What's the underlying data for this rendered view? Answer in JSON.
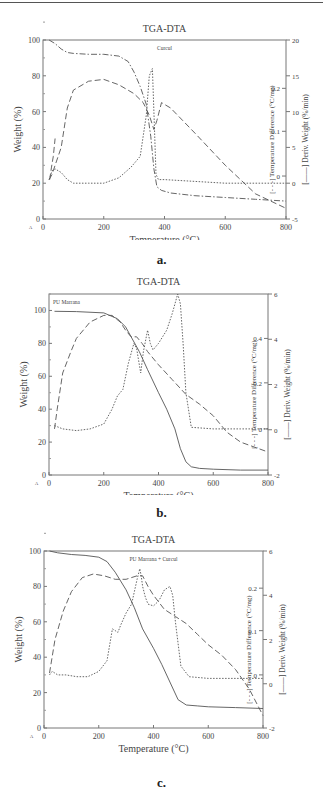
{
  "chart_data": [
    {
      "id": "a",
      "type": "line",
      "caption": "a.",
      "title": "TGA-DTA",
      "sample_label": "Curcul",
      "xlabel": "Temperature (°C)",
      "ylabel": "Weight (%)",
      "y2label": "Temperature Difference (°C/mg)",
      "y3label": "Deriv. Weight (%/min)",
      "xlim": [
        0,
        800
      ],
      "ylim": [
        0,
        100
      ],
      "y2_ticks": [
        {
          "label": "0.2",
          "weight_equiv": 73
        },
        {
          "label": "0.1",
          "weight_equiv": 49
        },
        {
          "label": "0",
          "weight_equiv": 24
        }
      ],
      "y3lim": [
        -5,
        20
      ],
      "xticks": [
        "0",
        "200",
        "400",
        "600",
        "800"
      ],
      "yticks": [
        "0",
        "20",
        "40",
        "60",
        "80",
        "100"
      ],
      "y3ticks": [
        "-5",
        "0",
        "5",
        "10",
        "15",
        "20"
      ],
      "series": [
        {
          "name": "Weight (TGA)",
          "style": "dashdot",
          "x": [
            20,
            40,
            60,
            80,
            100,
            150,
            200,
            250,
            280,
            300,
            320,
            340,
            355,
            365,
            375,
            390,
            420,
            500,
            600,
            700,
            800
          ],
          "y": [
            100,
            98,
            95,
            93,
            92.5,
            92,
            92,
            91,
            88,
            82,
            74,
            64,
            46,
            28,
            18,
            16,
            14.5,
            13,
            12,
            11,
            10
          ]
        },
        {
          "name": "DTA",
          "style": "dashed",
          "x": [
            20,
            30,
            40,
            60,
            80,
            100,
            150,
            200,
            250,
            300,
            330,
            350,
            365,
            375,
            390,
            420,
            500,
            600,
            700,
            800
          ],
          "y": [
            22,
            25,
            30,
            40,
            62,
            72,
            77,
            78,
            75,
            70,
            65,
            58,
            50,
            55,
            65,
            62,
            48,
            30,
            14,
            6
          ]
        },
        {
          "name": "Deriv. Weight (DTG)",
          "style": "dotted",
          "x": [
            20,
            30,
            40,
            60,
            80,
            100,
            150,
            200,
            250,
            290,
            320,
            340,
            350,
            360,
            365,
            372,
            380,
            400,
            500,
            600,
            700,
            800
          ],
          "y": [
            22,
            27,
            28,
            26,
            22,
            20,
            20,
            20,
            23,
            29,
            35,
            58,
            80,
            84,
            60,
            25,
            22,
            22,
            21,
            20,
            20,
            20
          ]
        },
        {
          "name": "Early spike",
          "style": "dashed",
          "x": [
            22,
            28,
            34,
            40
          ],
          "y": [
            22,
            29,
            35,
            45
          ]
        }
      ]
    },
    {
      "id": "b",
      "type": "line",
      "caption": "b.",
      "title": "TGA-DTA",
      "sample_label": "PU Marrana",
      "xlabel": "Temperature (°C)",
      "ylabel": "Weight (%)",
      "y2label": "Temperature Difference (°C/mg)",
      "y3label": "Deriv. Weight (%/min)",
      "xlim": [
        0,
        800
      ],
      "ylim": [
        0,
        110
      ],
      "y2_ticks": [
        {
          "label": "0.4",
          "weight_equiv": 83
        },
        {
          "label": "0.2",
          "weight_equiv": 56
        },
        {
          "label": "0",
          "weight_equiv": 28
        }
      ],
      "y3lim": [
        -2,
        6
      ],
      "xticks": [
        "0",
        "200",
        "400",
        "600",
        "800"
      ],
      "yticks": [
        "0",
        "20",
        "40",
        "60",
        "80",
        "100"
      ],
      "y3ticks": [
        "-2",
        "0",
        "2",
        "4",
        "6"
      ],
      "series": [
        {
          "name": "Weight (TGA)",
          "style": "solid",
          "x": [
            20,
            100,
            200,
            250,
            280,
            300,
            330,
            360,
            400,
            430,
            460,
            480,
            500,
            520,
            550,
            600,
            700,
            800
          ],
          "y": [
            99.5,
            99.3,
            98.5,
            95,
            90,
            84,
            75,
            64,
            50,
            40,
            28,
            16,
            8,
            5,
            4,
            3.5,
            3,
            3
          ]
        },
        {
          "name": "DTA",
          "style": "dashed",
          "x": [
            20,
            30,
            50,
            80,
            100,
            150,
            200,
            230,
            260,
            280,
            300,
            320,
            340,
            360,
            400,
            450,
            500,
            550,
            600,
            650,
            700,
            800
          ],
          "y": [
            28,
            40,
            62,
            75,
            83,
            93,
            97,
            97,
            93,
            88,
            84,
            84,
            80,
            75,
            67,
            58,
            49,
            43,
            36,
            26,
            20,
            14
          ]
        },
        {
          "name": "Deriv. Weight (DTG)",
          "style": "dotted",
          "x": [
            20,
            50,
            100,
            150,
            200,
            230,
            250,
            270,
            290,
            310,
            320,
            335,
            345,
            360,
            370,
            380,
            400,
            430,
            450,
            470,
            480,
            490,
            500,
            520,
            600,
            700,
            800
          ],
          "y": [
            30,
            28,
            27,
            28,
            31,
            40,
            48,
            52,
            68,
            80,
            77,
            62,
            75,
            88,
            80,
            76,
            80,
            88,
            98,
            110,
            104,
            80,
            50,
            29,
            28,
            28,
            28
          ]
        }
      ]
    },
    {
      "id": "c",
      "type": "line",
      "caption": "c.",
      "title": "TGA-DTA",
      "sample_label": "PU Marrana + Curcul",
      "xlabel": "Temperature (°C)",
      "ylabel": "Weight (%)",
      "y2label": "Temperature Difference (°C/mg)",
      "y3label": "Deriv. Weight (%/min)",
      "xlim": [
        0,
        800
      ],
      "ylim": [
        0,
        100
      ],
      "y2_ticks": [
        {
          "label": "0.2",
          "weight_equiv": 79
        },
        {
          "label": "0.1",
          "weight_equiv": 55
        },
        {
          "label": "0",
          "weight_equiv": 30
        }
      ],
      "y3lim": [
        -2,
        6
      ],
      "xticks": [
        "0",
        "200",
        "400",
        "600",
        "800"
      ],
      "yticks": [
        "0",
        "20",
        "40",
        "60",
        "80",
        "100"
      ],
      "y3ticks": [
        "-2",
        "0",
        "2",
        "4",
        "6"
      ],
      "series": [
        {
          "name": "Weight (TGA)",
          "style": "solid",
          "x": [
            20,
            50,
            100,
            150,
            200,
            230,
            260,
            300,
            330,
            360,
            400,
            430,
            460,
            490,
            520,
            560,
            600,
            700,
            800
          ],
          "y": [
            100,
            99,
            98,
            97.5,
            96.5,
            94,
            88,
            78,
            68,
            56,
            45,
            36,
            26,
            16,
            13,
            12.5,
            12,
            11.5,
            11
          ]
        },
        {
          "name": "DTA",
          "style": "dashed",
          "x": [
            20,
            40,
            70,
            100,
            140,
            180,
            220,
            260,
            300,
            340,
            360,
            380,
            400,
            440,
            480,
            520,
            560,
            600,
            650,
            700,
            750,
            800
          ],
          "y": [
            31,
            50,
            66,
            77,
            85,
            87,
            86,
            84,
            84,
            86,
            86,
            80,
            75,
            67,
            63,
            59,
            53,
            47,
            41,
            33,
            22,
            7
          ]
        },
        {
          "name": "Deriv. Weight (DTG)",
          "style": "dotted",
          "x": [
            20,
            30,
            50,
            80,
            120,
            160,
            200,
            230,
            250,
            260,
            270,
            280,
            300,
            320,
            340,
            350,
            355,
            360,
            370,
            380,
            400,
            420,
            440,
            460,
            470,
            480,
            500,
            530,
            600,
            700,
            800
          ],
          "y": [
            30,
            32,
            30,
            30,
            29,
            29,
            32,
            38,
            56,
            55,
            54,
            58,
            65,
            70,
            84,
            90,
            86,
            80,
            74,
            70,
            69,
            72,
            78,
            80,
            75,
            60,
            35,
            29,
            28,
            28,
            28
          ]
        }
      ]
    }
  ]
}
